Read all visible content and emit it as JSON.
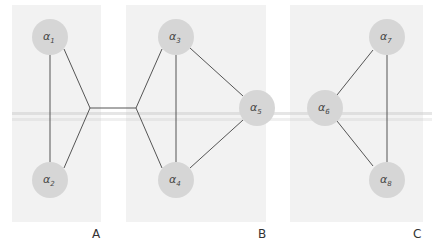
{
  "panels": [
    {
      "id": "A",
      "label": "A"
    },
    {
      "id": "B",
      "label": "B"
    },
    {
      "id": "C",
      "label": "C"
    }
  ],
  "nodes": [
    {
      "id": "a1",
      "base": "α",
      "sub": "1"
    },
    {
      "id": "a2",
      "base": "α",
      "sub": "2"
    },
    {
      "id": "a3",
      "base": "α",
      "sub": "3"
    },
    {
      "id": "a4",
      "base": "α",
      "sub": "4"
    },
    {
      "id": "a5",
      "base": "α",
      "sub": "5"
    },
    {
      "id": "a6",
      "base": "α",
      "sub": "6"
    },
    {
      "id": "a7",
      "base": "α",
      "sub": "7"
    },
    {
      "id": "a8",
      "base": "α",
      "sub": "8"
    }
  ],
  "edges": [
    [
      "a1",
      "a2"
    ],
    [
      "a1",
      "j1"
    ],
    [
      "a2",
      "j1"
    ],
    [
      "j1",
      "j2"
    ],
    [
      "j2",
      "a3"
    ],
    [
      "j2",
      "a4"
    ],
    [
      "a3",
      "a4"
    ],
    [
      "a3",
      "a5"
    ],
    [
      "a4",
      "a5"
    ],
    [
      "a6",
      "a7"
    ],
    [
      "a6",
      "a8"
    ],
    [
      "a7",
      "a8"
    ]
  ],
  "colors": {
    "panel": "#f2f2f2",
    "node": "#d6d6d6",
    "edge": "#555555"
  }
}
